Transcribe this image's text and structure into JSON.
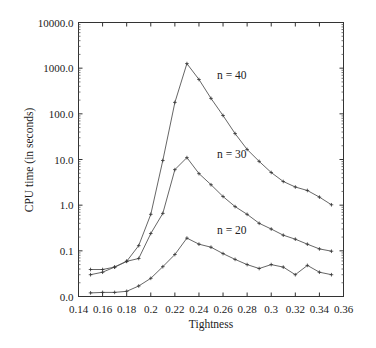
{
  "chart_data": {
    "type": "line",
    "title": "",
    "xlabel": "Tightness",
    "ylabel": "CPU time (in seconds)",
    "yscale": "log",
    "xlim": [
      0.14,
      0.36
    ],
    "ylim": [
      0.01,
      10000
    ],
    "grid": false,
    "legend": "inline labels",
    "x_ticks": [
      "0.14",
      "0.16",
      "0.18",
      "0.2",
      "0.22",
      "0.24",
      "0.26",
      "0.28",
      "0.3",
      "0.32",
      "0.34",
      "0.36"
    ],
    "y_ticks": [
      "0.0",
      "0.1",
      "1.0",
      "10.0",
      "100.0",
      "1000.0",
      "10000.0"
    ],
    "x": [
      0.15,
      0.16,
      0.17,
      0.18,
      0.19,
      0.2,
      0.21,
      0.22,
      0.23,
      0.24,
      0.25,
      0.26,
      0.27,
      0.28,
      0.29,
      0.3,
      0.31,
      0.32,
      0.33,
      0.34,
      0.35
    ],
    "series": [
      {
        "name": "n = 40",
        "values": [
          0.039,
          0.039,
          0.044,
          0.059,
          0.13,
          0.63,
          9.5,
          178,
          1260,
          565,
          218,
          92,
          37,
          16.6,
          9.1,
          5.2,
          3.3,
          2.5,
          2.1,
          1.5,
          1.02
        ]
      },
      {
        "name": "n = 30",
        "values": [
          0.03,
          0.034,
          0.044,
          0.059,
          0.068,
          0.24,
          0.66,
          6.0,
          11,
          4.9,
          2.8,
          1.55,
          0.93,
          0.63,
          0.4,
          0.3,
          0.22,
          0.18,
          0.14,
          0.11,
          0.098
        ]
      },
      {
        "name": "n = 20",
        "values": [
          0.012,
          0.0123,
          0.0123,
          0.013,
          0.017,
          0.025,
          0.045,
          0.083,
          0.19,
          0.14,
          0.12,
          0.087,
          0.065,
          0.05,
          0.041,
          0.05,
          0.044,
          0.03,
          0.048,
          0.034,
          0.03
        ]
      }
    ],
    "annotations": [
      {
        "text": "n = 40",
        "x": 0.255,
        "y": 700
      },
      {
        "text": "n = 30",
        "x": 0.255,
        "y": 13
      },
      {
        "text": "n = 20",
        "x": 0.255,
        "y": 0.28
      }
    ]
  }
}
